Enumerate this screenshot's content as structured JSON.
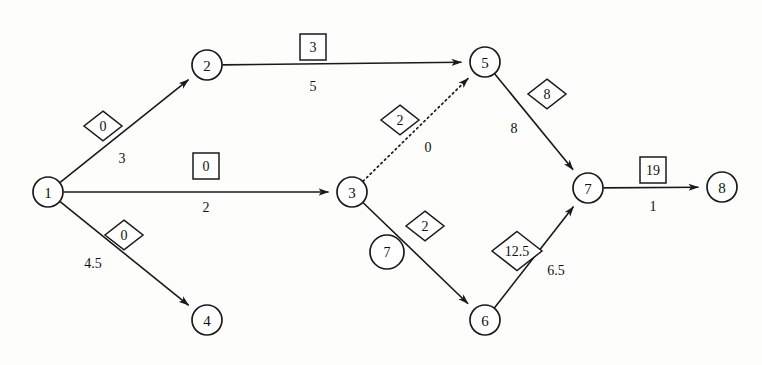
{
  "diagram": {
    "type": "directed-network",
    "colors": {
      "stroke": "#1a1a1a",
      "fill": "#ffffff",
      "background": "#fdfdfc"
    },
    "nodes": [
      {
        "id": "1",
        "label": "1",
        "x": 48,
        "y": 192
      },
      {
        "id": "2",
        "label": "2",
        "x": 207,
        "y": 65
      },
      {
        "id": "3",
        "label": "3",
        "x": 352,
        "y": 192
      },
      {
        "id": "4",
        "label": "4",
        "x": 207,
        "y": 320
      },
      {
        "id": "5",
        "label": "5",
        "x": 485,
        "y": 62
      },
      {
        "id": "6",
        "label": "6",
        "x": 485,
        "y": 320
      },
      {
        "id": "7",
        "label": "7",
        "x": 588,
        "y": 188
      },
      {
        "id": "8",
        "label": "8",
        "x": 722,
        "y": 187
      }
    ],
    "edges": [
      {
        "id": "e1-2",
        "from": "1",
        "to": "2",
        "style": "solid",
        "flow_label": "0",
        "flow_shape": "diamond",
        "flow_x": 103,
        "flow_y": 126,
        "cost_label": "3",
        "cost_x": 122,
        "cost_y": 158
      },
      {
        "id": "e1-3",
        "from": "1",
        "to": "3",
        "style": "solid",
        "flow_label": "0",
        "flow_shape": "square",
        "flow_x": 206,
        "flow_y": 166,
        "cost_label": "2",
        "cost_x": 206,
        "cost_y": 207
      },
      {
        "id": "e1-4",
        "from": "1",
        "to": "4",
        "style": "solid",
        "flow_label": "0",
        "flow_shape": "diamond",
        "flow_x": 124,
        "flow_y": 235,
        "cost_label": "4.5",
        "cost_x": 93,
        "cost_y": 263
      },
      {
        "id": "e2-5",
        "from": "2",
        "to": "5",
        "style": "solid",
        "flow_label": "3",
        "flow_shape": "square",
        "flow_x": 313,
        "flow_y": 47,
        "cost_label": "5",
        "cost_x": 313,
        "cost_y": 86
      },
      {
        "id": "e3-5",
        "from": "3",
        "to": "5",
        "style": "dotted",
        "flow_label": "2",
        "flow_shape": "diamond",
        "flow_x": 400,
        "flow_y": 120,
        "cost_label": "0",
        "cost_x": 428,
        "cost_y": 147
      },
      {
        "id": "e3-6",
        "from": "3",
        "to": "6",
        "style": "solid",
        "flow_label": "2",
        "flow_shape": "diamond",
        "flow_x": 425,
        "flow_y": 226,
        "cost_label": "7",
        "cost_x": 387,
        "cost_y": 252,
        "cost_shape": "circle"
      },
      {
        "id": "e5-7",
        "from": "5",
        "to": "7",
        "style": "solid",
        "flow_label": "8",
        "flow_shape": "diamond",
        "flow_x": 547,
        "flow_y": 94,
        "cost_label": "8",
        "cost_x": 514,
        "cost_y": 128
      },
      {
        "id": "e6-7",
        "from": "6",
        "to": "7",
        "style": "solid",
        "flow_label": "12.5",
        "flow_shape": "diamond",
        "flow_x": 517,
        "flow_y": 251,
        "cost_label": "6.5",
        "cost_x": 556,
        "cost_y": 270
      },
      {
        "id": "e7-8",
        "from": "7",
        "to": "8",
        "style": "solid",
        "flow_label": "19",
        "flow_shape": "square",
        "flow_x": 653,
        "flow_y": 170,
        "cost_label": "1",
        "cost_x": 653,
        "cost_y": 206
      }
    ]
  }
}
